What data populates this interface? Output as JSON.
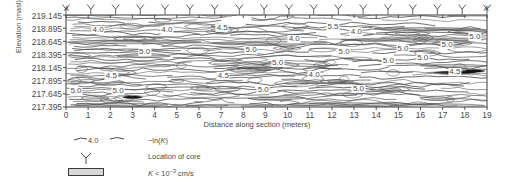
{
  "chart_data": {
    "type": "contour",
    "title": "",
    "xlabel": "Distance along section (meters)",
    "ylabel": "Elevation (masl)",
    "xlim": [
      0,
      19
    ],
    "ylim": [
      217.395,
      219.145
    ],
    "xticks": [
      0,
      1,
      2,
      3,
      4,
      5,
      6,
      7,
      8,
      9,
      10,
      11,
      12,
      13,
      14,
      15,
      16,
      17,
      18,
      19
    ],
    "yticks": [
      219.145,
      218.895,
      218.645,
      218.395,
      218.145,
      217.895,
      217.645,
      217.395
    ],
    "grid": false,
    "section_start_label": "A",
    "section_end_label": "A'",
    "contour_levels": [
      4.0,
      4.5,
      5.0,
      5.5
    ],
    "contour_label_unit": "-ln(K)",
    "core_count": 18,
    "core_x_positions": [
      0,
      1.12,
      2.24,
      3.35,
      4.47,
      5.59,
      6.71,
      7.82,
      8.94,
      10.06,
      11.18,
      12.29,
      13.41,
      14.53,
      15.65,
      16.76,
      17.88,
      19
    ],
    "contour_labels": [
      {
        "x": 1.45,
        "y": 218.86,
        "text": "4.0"
      },
      {
        "x": 4.55,
        "y": 218.86,
        "text": "4.0"
      },
      {
        "x": 7.05,
        "y": 218.9,
        "text": "4.5"
      },
      {
        "x": 12.05,
        "y": 218.92,
        "text": "5.5"
      },
      {
        "x": 13.1,
        "y": 218.82,
        "text": "4.0"
      },
      {
        "x": 10.3,
        "y": 218.69,
        "text": "4.0"
      },
      {
        "x": 18.45,
        "y": 218.72,
        "text": "5.0"
      },
      {
        "x": 3.55,
        "y": 218.44,
        "text": "5.0"
      },
      {
        "x": 8.35,
        "y": 218.47,
        "text": "5.0"
      },
      {
        "x": 12.55,
        "y": 218.44,
        "text": "5.0"
      },
      {
        "x": 15.2,
        "y": 218.5,
        "text": "5.0"
      },
      {
        "x": 17.2,
        "y": 218.58,
        "text": "5.0"
      },
      {
        "x": 9.55,
        "y": 218.23,
        "text": "5.0"
      },
      {
        "x": 16.1,
        "y": 218.32,
        "text": "5.0"
      },
      {
        "x": 14.55,
        "y": 218.27,
        "text": "5.0"
      },
      {
        "x": 2.05,
        "y": 217.98,
        "text": "4.5"
      },
      {
        "x": 7.1,
        "y": 217.99,
        "text": "4.5"
      },
      {
        "x": 11.2,
        "y": 218.01,
        "text": "4.0"
      },
      {
        "x": 17.55,
        "y": 218.07,
        "text": "4.5"
      },
      {
        "x": 0.45,
        "y": 217.7,
        "text": "5.0"
      },
      {
        "x": 2.35,
        "y": 217.7,
        "text": "5.0"
      },
      {
        "x": 8.9,
        "y": 217.72,
        "text": "5.0"
      },
      {
        "x": 13.2,
        "y": 217.74,
        "text": "5.0"
      }
    ]
  },
  "legend": {
    "items": [
      {
        "symbol": "contour-line-sample",
        "sample_label": "4.0",
        "text": "-ln(K)"
      },
      {
        "symbol": "core-marker",
        "sample_label": "",
        "text": "Location of core"
      },
      {
        "symbol": "gray-swatch",
        "sample_label": "",
        "text": "K < 10-3 cm/s"
      }
    ],
    "swatch_color": "#d8d8d8",
    "line_color": "#3a3a3a"
  },
  "colors": {
    "axis": "#3a3a3a",
    "text": "#4a4a4a",
    "contour": "#4d4d4d",
    "lowk_fill": "#c9c9c9",
    "lowk_dark": "#111111",
    "background": "#ffffff"
  }
}
